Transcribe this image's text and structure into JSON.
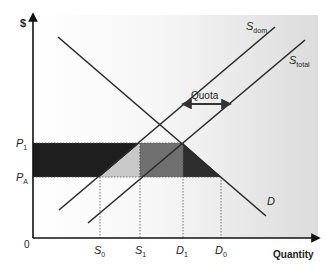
{
  "diagram": {
    "y_axis_label": "$",
    "x_axis_label": "Quantity",
    "origin_label": "0",
    "price_labels": [
      {
        "main": "P",
        "sub": "1"
      },
      {
        "main": "P",
        "sub": "A"
      }
    ],
    "quantity_labels": [
      {
        "main": "S",
        "sub": "0"
      },
      {
        "main": "S",
        "sub": "1"
      },
      {
        "main": "D",
        "sub": "1"
      },
      {
        "main": "D",
        "sub": "0"
      }
    ],
    "curves": {
      "demand": {
        "main": "D",
        "sub": ""
      },
      "supply_domestic": {
        "main": "S",
        "sub": "dom"
      },
      "supply_total": {
        "main": "S",
        "sub": "total"
      }
    },
    "annotation": "Quota",
    "colors": {
      "consumer_loss_dark": "#1e1e1e",
      "producer_gain_light": "#c8c8c8",
      "quota_rent_mid": "#707070",
      "deadweight_dark": "#2e2e2e",
      "lines": "#2a2a2a",
      "background_gradient_end": "#dcdcdc"
    }
  }
}
